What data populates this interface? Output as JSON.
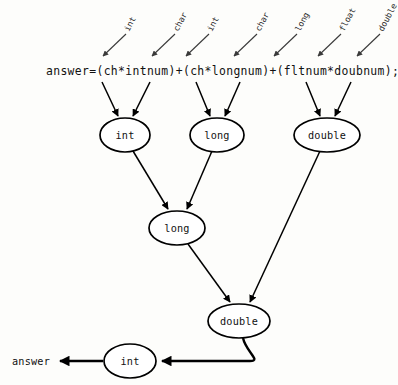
{
  "diagram": {
    "code_expression": "answer=(ch*intnum)+(ch*longnum)+(fltnum*doubnum);",
    "result_label": "answer",
    "annotations": [
      {
        "label": "int",
        "tip_x": 103,
        "tip_y": 56,
        "tail_x": 126,
        "tail_y": 34
      },
      {
        "label": "char",
        "tip_x": 152,
        "tip_y": 56,
        "tail_x": 175,
        "tail_y": 34
      },
      {
        "label": "int",
        "tip_x": 186,
        "tip_y": 56,
        "tail_x": 209,
        "tail_y": 34
      },
      {
        "label": "char",
        "tip_x": 234,
        "tip_y": 56,
        "tail_x": 257,
        "tail_y": 34
      },
      {
        "label": "long",
        "tip_x": 274,
        "tip_y": 56,
        "tail_x": 297,
        "tail_y": 34
      },
      {
        "label": "float",
        "tip_x": 318,
        "tip_y": 56,
        "tail_x": 341,
        "tail_y": 34
      },
      {
        "label": "double",
        "tip_x": 357,
        "tip_y": 56,
        "tail_x": 380,
        "tail_y": 34
      }
    ],
    "nodes": [
      {
        "id": "node-int-top",
        "label": "int",
        "cx": 125,
        "cy": 135,
        "rx": 25,
        "ry": 17
      },
      {
        "id": "node-long-top",
        "label": "long",
        "cx": 217,
        "cy": 135,
        "rx": 27,
        "ry": 17
      },
      {
        "id": "node-double-top",
        "label": "double",
        "cx": 327,
        "cy": 135,
        "rx": 33,
        "ry": 17
      },
      {
        "id": "node-long-mid",
        "label": "long",
        "cx": 177,
        "cy": 228,
        "rx": 28,
        "ry": 17
      },
      {
        "id": "node-double-low",
        "label": "double",
        "cx": 239,
        "cy": 321,
        "rx": 31,
        "ry": 17
      },
      {
        "id": "node-int-result",
        "label": "int",
        "cx": 130,
        "cy": 361,
        "rx": 26,
        "ry": 17
      }
    ],
    "colors": {
      "background": "#fdfdfb",
      "ink": "#000000",
      "annotation_ink": "#2a2a2a"
    }
  }
}
